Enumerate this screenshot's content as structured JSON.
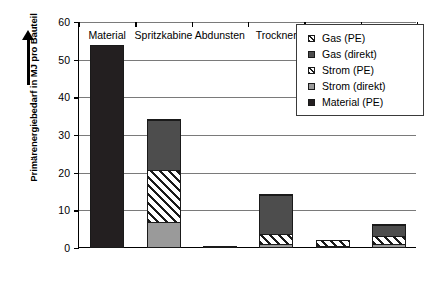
{
  "chart_data": {
    "type": "bar",
    "stacked": true,
    "title": "",
    "xlabel": "",
    "ylabel": "Primärenergiebedarf in MJ pro Bauteil",
    "ylim": [
      0,
      60
    ],
    "yticks": [
      0,
      10,
      20,
      30,
      40,
      50,
      60
    ],
    "grid": "horizontal",
    "legend_position": "top-right",
    "categories": [
      "Material",
      "Spritzkabine",
      "Abdunsten",
      "Trockner",
      "Kühlzone",
      "Peripherie"
    ],
    "series": [
      {
        "name": "Material (PE)",
        "key": "material",
        "color": "#231f20",
        "pattern": "solid",
        "values": [
          54,
          0,
          0,
          0,
          0,
          0
        ]
      },
      {
        "name": "Strom (direkt)",
        "key": "stromdirekt",
        "color": "#9a9a9a",
        "pattern": "solid",
        "values": [
          0,
          7,
          0,
          1.1,
          0.2,
          1.0
        ]
      },
      {
        "name": "Strom (PE)",
        "key": "strompe",
        "color": "#ffffff",
        "pattern": "hatch",
        "values": [
          0,
          14,
          0.3,
          2.9,
          1.9,
          2.5
        ]
      },
      {
        "name": "Gas (direkt)",
        "key": "gasdirekt",
        "color": "#4d4d4d",
        "pattern": "solid",
        "values": [
          0,
          13.5,
          0,
          10.5,
          0,
          3.2
        ]
      },
      {
        "name": "Gas (PE)",
        "key": "gaspe",
        "color": "#ffffff",
        "pattern": "hatch",
        "values": [
          0,
          0.5,
          0,
          0.5,
          0,
          0.3
        ]
      }
    ],
    "totals": [
      54,
      35,
      0.3,
      15,
      2.1,
      7
    ]
  },
  "legend": {
    "entries": [
      {
        "swatch": "gaspe",
        "label": "Gas (PE)"
      },
      {
        "swatch": "gasdirekt",
        "label": "Gas (direkt)"
      },
      {
        "swatch": "strompe",
        "label": "Strom (PE)"
      },
      {
        "swatch": "stromdirekt",
        "label": "Strom (direkt)"
      },
      {
        "swatch": "material",
        "label": "Material (PE)"
      }
    ]
  },
  "axis": {
    "y_title": "Primärenergiebedarf in MJ pro Bauteil",
    "y_tick_labels": [
      "60",
      "50",
      "40",
      "30",
      "20",
      "10",
      "0"
    ],
    "x_tick_labels": [
      "Material",
      "Spritzkabine",
      "Abdunsten",
      "Trockner",
      "Kühlzone",
      "Peripherie"
    ]
  }
}
